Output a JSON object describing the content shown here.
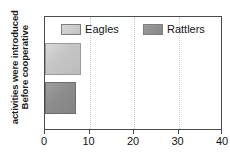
{
  "chart_data": {
    "type": "bar",
    "orientation": "horizontal",
    "title": "",
    "xlabel": "",
    "ylabel": "Before cooperative activities were introduced",
    "ylabel_lines": [
      "Before cooperative",
      "activities were introduced"
    ],
    "categories": [
      "Before cooperative activities were introduced"
    ],
    "series": [
      {
        "name": "Eagles",
        "values": [
          8
        ],
        "color": "#c8c8c8"
      },
      {
        "name": "Rattlers",
        "values": [
          7
        ],
        "color": "#919191"
      }
    ],
    "xlim": [
      0,
      40
    ],
    "xticks": [
      0,
      10,
      20,
      30,
      40
    ],
    "xtick_labels": [
      "0",
      "10",
      "20",
      "30",
      "40"
    ],
    "grid": true,
    "grid_axis": "x",
    "legend_position": "top-inside"
  },
  "legend": {
    "items": [
      {
        "label": "Eagles",
        "key": "eagles"
      },
      {
        "label": "Rattlers",
        "key": "rattlers"
      }
    ]
  },
  "colors": {
    "eagles": "#c8c8c8",
    "rattlers": "#919191",
    "axis": "#4a4a4a",
    "grid": "#c9c9c9",
    "text": "#141414",
    "background": "#ffffff"
  }
}
